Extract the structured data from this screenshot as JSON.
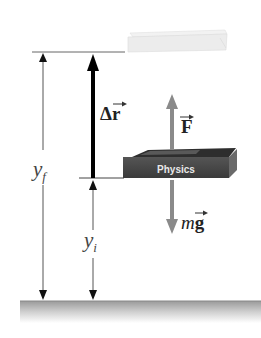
{
  "diagram": {
    "labels": {
      "displacement": "Δr",
      "force": "F",
      "gravity_m": "m",
      "gravity_g": "g",
      "y_final": "y",
      "y_final_sub": "f",
      "y_initial": "y",
      "y_initial_sub": "i",
      "book_title": "Physics"
    },
    "colors": {
      "displacement_arrow": "#000000",
      "force_arrow": "#8a8a8a",
      "book": "#4a4a4a",
      "faded_book": "#ececec",
      "ground": "#b5b5b5",
      "dimension_lines": "#555555"
    }
  }
}
